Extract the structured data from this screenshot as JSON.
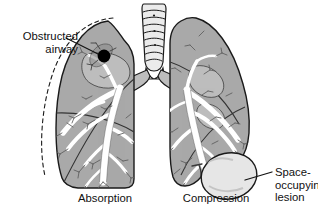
{
  "figure": {
    "labels": {
      "obstructed_airway": "Obstructed\nairway",
      "space_occupying_lesion": "Space-\noccupying\nlesion"
    },
    "captions": {
      "left_lung": "Absorption",
      "right_lung": "Compression"
    },
    "colors": {
      "background": "#ffffff",
      "outline": "#1a1a1a",
      "lung_fill": "#a9a9a9",
      "lung_fill_light": "#bdbdbd",
      "bronchi_fill": "#ffffff",
      "trachea_fill": "#e8e8e8",
      "lesion_fill": "#e6e6e6",
      "obstruction_fill": "#000000",
      "text": "#111111",
      "dashed_outline": "#1a1a1a"
    },
    "parts": {
      "trachea": "trachea-with-cartilage-rings",
      "carina": "carina",
      "left_main_bronchus": "left-main-bronchus",
      "right_main_bronchus": "right-main-bronchus",
      "left_lung": "collapsed-left-lung",
      "right_lung": "compressed-right-lung",
      "obstruction": "obstructing-plug",
      "lesion": "space-occupying-lesion",
      "original_outline": "dashed-original-lung-outline",
      "leader_obstructed": "leader-line-obstructed-airway",
      "leader_lesion": "leader-line-space-occupying-lesion"
    }
  }
}
